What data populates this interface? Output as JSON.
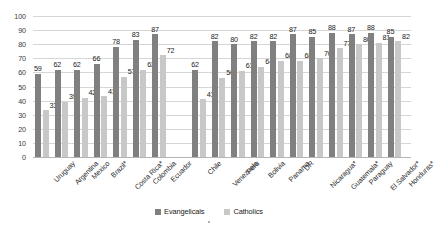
{
  "chart_data": {
    "type": "bar",
    "title": "",
    "xlabel": "",
    "ylabel": "",
    "ylim": [
      0,
      100
    ],
    "ytick_step": 10,
    "yticks": [
      "100",
      "90",
      "80",
      "70",
      "60",
      "50",
      "40",
      "30",
      "20",
      "10",
      "0"
    ],
    "grid": true,
    "legend_position": "bottom-center",
    "group_gap_after_index": 6,
    "categories": [
      "Uruguay",
      "Argentina",
      "Mexico",
      "Brazil*",
      "Costa Rica*",
      "Colombia",
      "Ecuador",
      "Chile",
      "Venezuela",
      "Peru",
      "Bolivia",
      "Panama",
      "DR",
      "Nicaragua*",
      "Guatemala*",
      "Paraguay",
      "El Salvador*",
      "Honduras*"
    ],
    "series": [
      {
        "name": "Evangelicals",
        "color": "#808080",
        "values": [
          59,
          62,
          62,
          66,
          78,
          83,
          87,
          62,
          82,
          80,
          82,
          82,
          87,
          85,
          88,
          87,
          88,
          85
        ]
      },
      {
        "name": "Catholics",
        "color": "#c8c8c8",
        "values": [
          33,
          39,
          42,
          43,
          57,
          62,
          72,
          41,
          56,
          61,
          64,
          68,
          68,
          70,
          77,
          80,
          81,
          82
        ]
      }
    ]
  },
  "legend": {
    "items": [
      {
        "label": "Evangelicals",
        "swatch": "evangelicals"
      },
      {
        "label": "Catholics",
        "swatch": "catholics"
      }
    ]
  }
}
